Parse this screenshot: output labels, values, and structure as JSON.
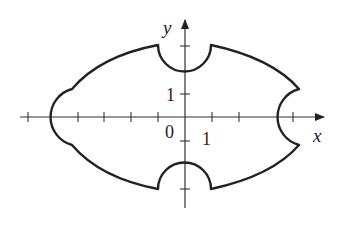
{
  "figure": {
    "type": "region-plot",
    "axes": {
      "x_label": "x",
      "y_label": "y",
      "origin_label": "0",
      "x_tick_label": "1",
      "y_tick_label": "1"
    },
    "colors": {
      "curve": "#222222",
      "axes": "#333333",
      "background": "#ffffff"
    }
  }
}
